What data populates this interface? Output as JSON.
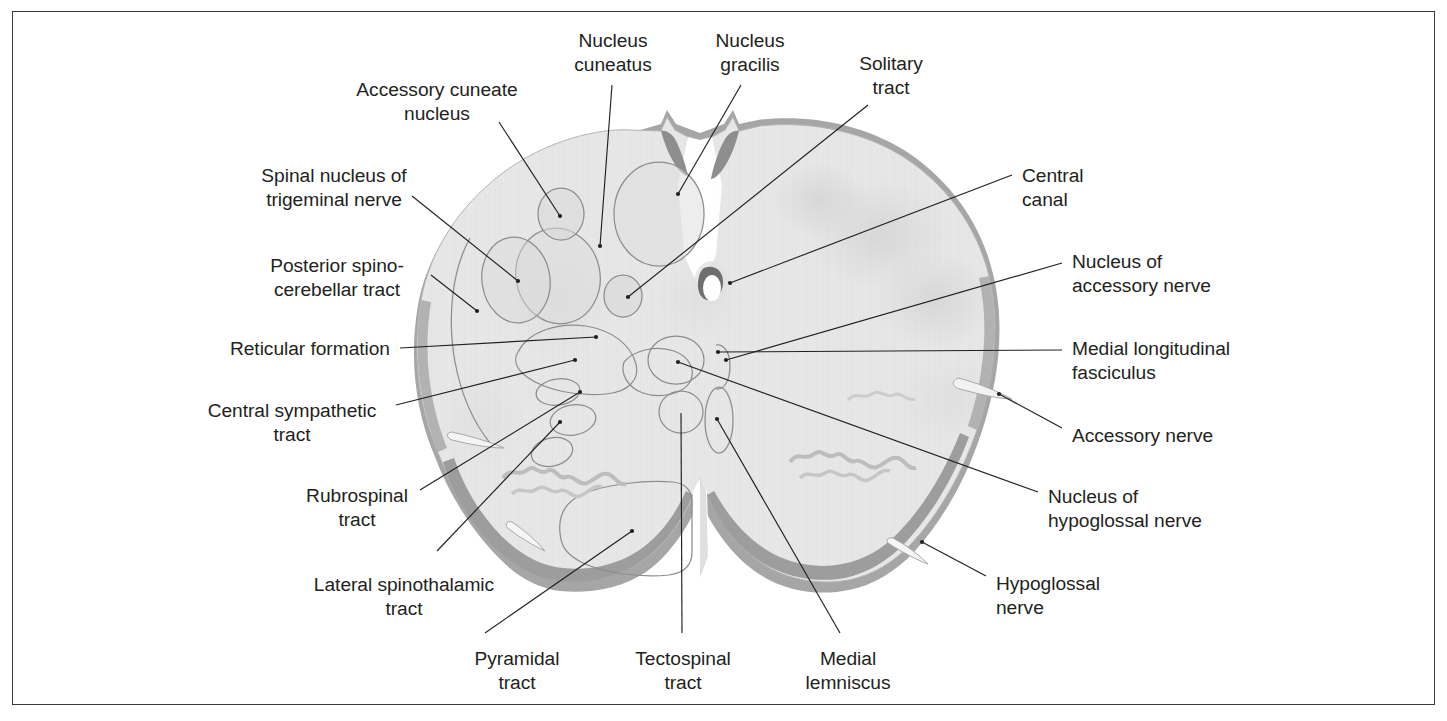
{
  "figure": {
    "frame_color": "#3a3a3c",
    "background_color": "#ffffff",
    "tissue_fill": "#e9e9e9",
    "tissue_edge": "#b0b0b0",
    "rim_dark": "#9a9a9a",
    "nucleus_outline": "#8d8d8d",
    "leader_color": "#231f20",
    "text_color": "#231f20"
  },
  "labels": [
    {
      "id": "nucleus-cuneatus",
      "lines": [
        "Nucleus",
        "cuneatus"
      ],
      "align": "center",
      "x": 613,
      "y": 29
    },
    {
      "id": "nucleus-gracilis",
      "lines": [
        "Nucleus",
        "gracilis"
      ],
      "align": "center",
      "x": 750,
      "y": 29
    },
    {
      "id": "solitary-tract",
      "lines": [
        "Solitary",
        "tract"
      ],
      "align": "center",
      "x": 891,
      "y": 52
    },
    {
      "id": "accessory-cuneate-nucleus",
      "lines": [
        "Accessory cuneate",
        "nucleus"
      ],
      "align": "center",
      "x": 437,
      "y": 78
    },
    {
      "id": "spinal-nucleus-trigeminal",
      "lines": [
        "Spinal nucleus of",
        "trigeminal nerve"
      ],
      "align": "center",
      "x": 334,
      "y": 164
    },
    {
      "id": "posterior-spinocerebellar",
      "lines": [
        "Posterior spino-",
        "cerebellar tract"
      ],
      "align": "center",
      "x": 337,
      "y": 254
    },
    {
      "id": "reticular-formation",
      "lines": [
        "Reticular formation"
      ],
      "align": "right",
      "x": 390,
      "y": 337
    },
    {
      "id": "central-sympathetic-tract",
      "lines": [
        "Central sympathetic",
        "tract"
      ],
      "align": "center",
      "x": 292,
      "y": 399
    },
    {
      "id": "rubrospinal-tract",
      "lines": [
        "Rubrospinal",
        "tract"
      ],
      "align": "center",
      "x": 357,
      "y": 484
    },
    {
      "id": "lateral-spinothalamic-tract",
      "lines": [
        "Lateral spinothalamic",
        "tract"
      ],
      "align": "center",
      "x": 404,
      "y": 573
    },
    {
      "id": "pyramidal-tract",
      "lines": [
        "Pyramidal",
        "tract"
      ],
      "align": "center",
      "x": 517,
      "y": 647
    },
    {
      "id": "tectospinal-tract",
      "lines": [
        "Tectospinal",
        "tract"
      ],
      "align": "center",
      "x": 683,
      "y": 647
    },
    {
      "id": "medial-lemniscus",
      "lines": [
        "Medial",
        "lemniscus"
      ],
      "align": "center",
      "x": 848,
      "y": 647
    },
    {
      "id": "central-canal",
      "lines": [
        "Central",
        "canal"
      ],
      "align": "left",
      "x": 1022,
      "y": 164
    },
    {
      "id": "nucleus-accessory-nerve",
      "lines": [
        "Nucleus of",
        "accessory nerve"
      ],
      "align": "left",
      "x": 1072,
      "y": 250
    },
    {
      "id": "medial-longitudinal-fasciculus",
      "lines": [
        "Medial longitudinal",
        "fasciculus"
      ],
      "align": "left",
      "x": 1072,
      "y": 337
    },
    {
      "id": "accessory-nerve",
      "lines": [
        "Accessory nerve"
      ],
      "align": "left",
      "x": 1072,
      "y": 424
    },
    {
      "id": "nucleus-hypoglossal-nerve",
      "lines": [
        "Nucleus of",
        "hypoglossal nerve"
      ],
      "align": "left",
      "x": 1048,
      "y": 485
    },
    {
      "id": "hypoglossal-nerve",
      "lines": [
        "Hypoglossal",
        "nerve"
      ],
      "align": "left",
      "x": 996,
      "y": 572
    }
  ]
}
